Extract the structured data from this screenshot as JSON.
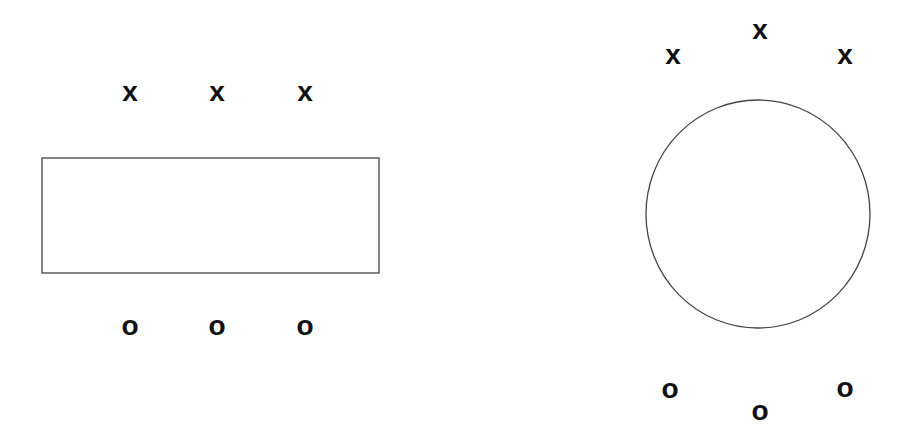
{
  "diagram": {
    "left": {
      "shape": "rectangle",
      "top_marks": [
        {
          "label": "x",
          "x": 130,
          "y": 92
        },
        {
          "label": "x",
          "x": 217,
          "y": 92
        },
        {
          "label": "x",
          "x": 305,
          "y": 92
        }
      ],
      "bottom_marks": [
        {
          "label": "o",
          "x": 130,
          "y": 328
        },
        {
          "label": "o",
          "x": 217,
          "y": 328
        },
        {
          "label": "o",
          "x": 305,
          "y": 328
        }
      ]
    },
    "right": {
      "shape": "circle",
      "top_marks": [
        {
          "label": "x",
          "x": 673,
          "y": 55
        },
        {
          "label": "x",
          "x": 760,
          "y": 30
        },
        {
          "label": "x",
          "x": 845,
          "y": 55
        }
      ],
      "bottom_marks": [
        {
          "label": "o",
          "x": 670,
          "y": 391
        },
        {
          "label": "o",
          "x": 760,
          "y": 413
        },
        {
          "label": "o",
          "x": 845,
          "y": 390
        }
      ]
    },
    "stroke_color": "#444444",
    "mark_color": "#111111"
  }
}
